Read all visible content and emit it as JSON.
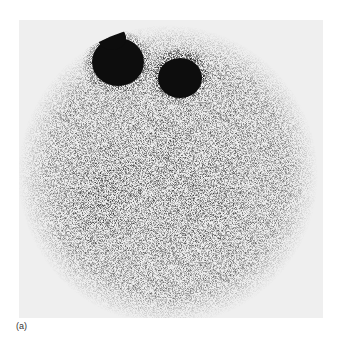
{
  "figure": {
    "type": "scintigraphy-scan",
    "caption": "(a)",
    "colors": {
      "background": "#ffffff",
      "frame_background": "#efefef",
      "field": "#e2e2e2",
      "hot_spot": "#0d0d0d",
      "caption_text": "#333333"
    },
    "regions": [
      {
        "name": "upper-left-hot-spot",
        "cx": 118,
        "cy": 58,
        "intensity": "very-high"
      },
      {
        "name": "upper-left-small-hot-spot",
        "cx": 105,
        "cy": 35,
        "intensity": "very-high"
      },
      {
        "name": "upper-right-hot-spot",
        "cx": 180,
        "cy": 75,
        "intensity": "very-high"
      },
      {
        "name": "left-lung-region",
        "cx": 100,
        "cy": 200,
        "intensity": "high"
      },
      {
        "name": "right-lung-region",
        "cx": 210,
        "cy": 200,
        "intensity": "medium"
      }
    ]
  }
}
